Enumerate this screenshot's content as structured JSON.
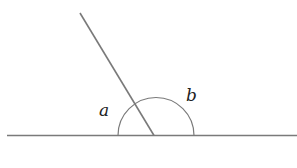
{
  "diagram": {
    "type": "angles-on-straight-line",
    "labels": {
      "angle_a": "a",
      "angle_b": "b"
    },
    "colors": {
      "line": "#7a7a7a",
      "arc": "#7a7a7a",
      "text": "#222222"
    }
  }
}
